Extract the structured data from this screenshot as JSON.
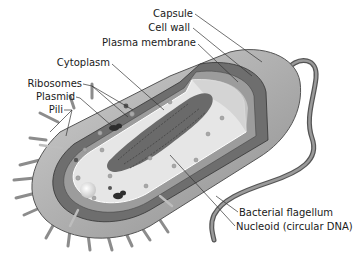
{
  "diagram": {
    "labels": {
      "capsule": "Capsule",
      "cell_wall": "Cell wall",
      "plasma_membrane": "Plasma membrane",
      "cytoplasm": "Cytoplasm",
      "ribosomes": "Ribosomes",
      "plasmid": "Plasmid",
      "pili": "Pili",
      "flagellum": "Bacterial flagellum",
      "nucleoid": "Nucleoid (circular DNA)"
    },
    "colors": {
      "capsule": "#a9a9a9",
      "cell_wall": "#6e6e6e",
      "membrane": "#8a8a8a",
      "cytoplasm": "#e4e4e4",
      "nucleoid": "#6a6a6a",
      "leader": "#333333"
    }
  }
}
